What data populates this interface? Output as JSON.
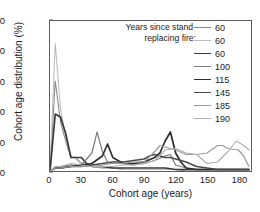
{
  "chart_data": {
    "type": "line",
    "title": "",
    "xlabel": "Cohort age (years)",
    "ylabel": "Cohort age distribution (%)",
    "xlim": [
      0,
      192
    ],
    "ylim": [
      0,
      100
    ],
    "xticks": [
      0,
      30,
      60,
      90,
      120,
      150,
      180
    ],
    "yticks": [
      0,
      20,
      40,
      60,
      80,
      100
    ],
    "grid": false,
    "legend_position": "top-right",
    "legend_title": "Years since stand-replacing fire:",
    "series": [
      {
        "name": "60",
        "color": "#8a8a8a",
        "width": 1.1,
        "x": [
          0,
          5,
          10,
          15,
          20,
          25,
          30,
          40,
          50,
          60,
          70,
          80,
          90,
          100,
          110,
          120,
          130,
          140,
          150,
          160,
          170,
          180,
          190
        ],
        "y": [
          0,
          60,
          33,
          20,
          9,
          9,
          5,
          3,
          2,
          2,
          1,
          1,
          1,
          1,
          1,
          1,
          0,
          0,
          0,
          0,
          0,
          0,
          0
        ]
      },
      {
        "name": "60",
        "color": "#bdbdbd",
        "width": 1.1,
        "x": [
          0,
          5,
          10,
          15,
          20,
          25,
          30,
          40,
          50,
          60,
          70,
          80,
          90,
          100,
          110,
          120,
          130,
          140,
          150,
          160,
          170,
          180,
          190
        ],
        "y": [
          0,
          85,
          42,
          22,
          10,
          8,
          4,
          3,
          2,
          2,
          1,
          1,
          1,
          1,
          1,
          1,
          1,
          0,
          0,
          0,
          0,
          0,
          0
        ]
      },
      {
        "name": "60",
        "color": "#3a3a3a",
        "width": 1.7,
        "x": [
          0,
          5,
          10,
          15,
          20,
          25,
          30,
          35,
          40,
          50,
          60,
          70,
          80,
          90,
          100,
          110,
          120,
          130,
          140,
          150,
          160,
          170,
          180,
          190
        ],
        "y": [
          0,
          38,
          36,
          25,
          9,
          9,
          9,
          5,
          3,
          3,
          2,
          2,
          2,
          2,
          2,
          2,
          1,
          1,
          1,
          1,
          1,
          1,
          1,
          1
        ]
      },
      {
        "name": "100",
        "color": "#7d7d7d",
        "width": 1.2,
        "x": [
          0,
          5,
          10,
          20,
          30,
          40,
          45,
          50,
          55,
          60,
          70,
          80,
          90,
          100,
          110,
          115,
          120,
          130,
          140,
          150,
          160,
          170,
          180,
          190
        ],
        "y": [
          0,
          2,
          3,
          4,
          4,
          12,
          26,
          13,
          6,
          5,
          5,
          4,
          5,
          7,
          10,
          11,
          4,
          2,
          1,
          1,
          1,
          1,
          1,
          1
        ]
      },
      {
        "name": "115",
        "color": "#2e2e2e",
        "width": 1.7,
        "x": [
          0,
          5,
          10,
          20,
          30,
          40,
          50,
          55,
          60,
          70,
          80,
          90,
          100,
          105,
          110,
          115,
          120,
          125,
          130,
          140,
          150,
          160,
          170,
          180,
          190
        ],
        "y": [
          0,
          2,
          2,
          3,
          4,
          5,
          10,
          18,
          9,
          5,
          5,
          6,
          9,
          12,
          20,
          26,
          12,
          6,
          2,
          1,
          1,
          1,
          1,
          1,
          1
        ]
      },
      {
        "name": "145",
        "color": "#4a4a4a",
        "width": 1.5,
        "x": [
          0,
          5,
          10,
          20,
          30,
          40,
          50,
          60,
          70,
          80,
          90,
          95,
          100,
          105,
          110,
          115,
          120,
          130,
          140,
          150,
          160,
          170,
          180,
          190
        ],
        "y": [
          0,
          2,
          2,
          3,
          3,
          4,
          5,
          6,
          6,
          7,
          8,
          10,
          11,
          10,
          9,
          9,
          8,
          6,
          3,
          2,
          1,
          1,
          1,
          1
        ]
      },
      {
        "name": "185",
        "color": "#9a9a9a",
        "width": 1.2,
        "x": [
          0,
          5,
          10,
          20,
          30,
          40,
          50,
          60,
          70,
          80,
          90,
          100,
          105,
          110,
          115,
          120,
          130,
          140,
          150,
          160,
          165,
          170,
          180,
          185,
          190
        ],
        "y": [
          0,
          2,
          2,
          3,
          3,
          3,
          4,
          5,
          5,
          6,
          6,
          13,
          17,
          16,
          15,
          14,
          11,
          11,
          12,
          17,
          17,
          15,
          14,
          10,
          3
        ]
      },
      {
        "name": "190",
        "color": "#b0b0b0",
        "width": 1.2,
        "x": [
          0,
          5,
          10,
          20,
          30,
          40,
          50,
          60,
          70,
          80,
          90,
          100,
          110,
          120,
          130,
          140,
          150,
          160,
          170,
          178,
          185,
          190
        ],
        "y": [
          0,
          3,
          3,
          5,
          4,
          3,
          3,
          3,
          4,
          4,
          5,
          7,
          14,
          15,
          12,
          11,
          5,
          6,
          13,
          20,
          17,
          14
        ]
      }
    ]
  },
  "legend": {
    "title_line1": "Years since stand-",
    "title_line2": "replacing fire:",
    "entries": [
      {
        "label": "60"
      },
      {
        "label": "60"
      },
      {
        "label": "60"
      },
      {
        "label": "100"
      },
      {
        "label": "115"
      },
      {
        "label": "145"
      },
      {
        "label": "185"
      },
      {
        "label": "190"
      }
    ]
  },
  "axes": {
    "x_title": "Cohort age (years)",
    "y_title": "Cohort age distribution (%)",
    "x_tick_labels": [
      "0",
      "30",
      "60",
      "90",
      "120",
      "150",
      "180"
    ],
    "y_tick_labels": [
      "0",
      "20",
      "40",
      "60",
      "80",
      "100"
    ]
  }
}
